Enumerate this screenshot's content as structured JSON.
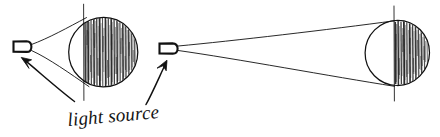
{
  "figure": {
    "caption": "light source",
    "ink_color": "#111111",
    "background_color": "#ffffff",
    "style": "hand-drawn pen sketch"
  },
  "scenes": [
    {
      "name": "near-light-scene",
      "label": "near light source illuminating sphere",
      "light_source": {
        "name": "left-light-source",
        "shape": "rounded-rectangle-bulb",
        "x": 12,
        "y": 41,
        "width": 19,
        "height": 11,
        "emitter_x": 31,
        "emitter_y": 47
      },
      "cone": {
        "name": "left-light-cone",
        "spread": "wide",
        "apex_x": 31,
        "apex_y": 47,
        "upper_contact_x": 85,
        "upper_contact_y": 18,
        "lower_contact_x": 88,
        "lower_contact_y": 86
      },
      "sphere": {
        "name": "left-sphere",
        "center_x": 103,
        "center_y": 52,
        "radius": 35,
        "terminator_x": 84,
        "terminator_top_y": 4,
        "terminator_bottom_y": 100,
        "shaded_side": "right",
        "hatching": "vertical"
      }
    },
    {
      "name": "far-light-scene",
      "label": "distant light source illuminating sphere",
      "light_source": {
        "name": "right-light-source",
        "shape": "rounded-rectangle-bulb",
        "x": 158,
        "y": 43,
        "width": 20,
        "height": 11,
        "emitter_x": 178,
        "emitter_y": 48
      },
      "cone": {
        "name": "right-light-cone",
        "spread": "narrow",
        "apex_x": 178,
        "apex_y": 48,
        "upper_contact_x": 394,
        "upper_contact_y": 21,
        "lower_contact_x": 394,
        "lower_contact_y": 86
      },
      "sphere": {
        "name": "right-sphere",
        "center_x": 397,
        "center_y": 53,
        "radius": 33,
        "terminator_x": 394,
        "terminator_top_y": 6,
        "terminator_bottom_y": 100,
        "shaded_side": "right",
        "hatching": "vertical"
      }
    }
  ],
  "annotations": [
    {
      "name": "left-callout-arrow",
      "points_to": "left-light-source",
      "tail_x": 74,
      "tail_y": 101,
      "tip_x": 22,
      "tip_y": 58
    },
    {
      "name": "right-callout-arrow",
      "points_to": "right-light-source",
      "tail_x": 146,
      "tail_y": 104,
      "tip_x": 166,
      "tip_y": 61
    }
  ],
  "caption": {
    "name": "light-source-caption",
    "text": "light source",
    "x": 68,
    "y": 126
  }
}
